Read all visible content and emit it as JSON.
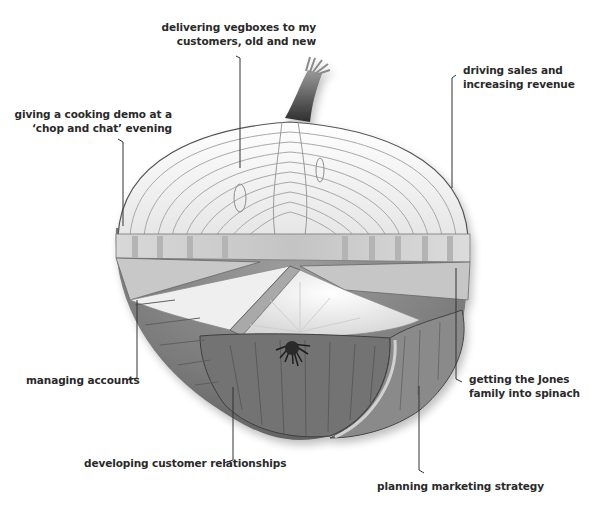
{
  "diagram": {
    "type": "labelled-illustration",
    "colors": {
      "text": "#2a2a2a",
      "leader_line": "#333333",
      "flesh_light": "#f2f2f2",
      "flesh_ring": "#9a9a9a",
      "skin_dark": "#6e6e6e",
      "skin_mid": "#8a8a8a",
      "root": "#2b2b2b"
    },
    "labels": {
      "vegboxes": {
        "line1": "delivering vegboxes to my",
        "line2": "customers, old and new"
      },
      "sales": {
        "line1": "driving sales and",
        "line2": "increasing revenue"
      },
      "cooking_demo": {
        "line1": "giving a cooking demo at a",
        "line2": "‘chop and chat’ evening"
      },
      "accounts": {
        "line1": "managing accounts"
      },
      "jones": {
        "line1": "getting the Jones",
        "line2": "family into spinach"
      },
      "relationships": {
        "line1": "developing customer relationships"
      },
      "marketing": {
        "line1": "planning marketing strategy"
      }
    }
  }
}
